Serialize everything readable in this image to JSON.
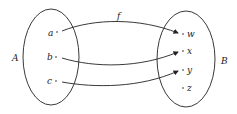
{
  "diagram": {
    "type": "function-mapping",
    "function_label": "f",
    "domain": {
      "label": "A",
      "elements": [
        "a",
        "b",
        "c"
      ]
    },
    "codomain": {
      "label": "B",
      "elements": [
        "w",
        "x",
        "y",
        "z"
      ]
    },
    "mappings": [
      {
        "from": "a",
        "to": "w"
      },
      {
        "from": "b",
        "to": "x"
      },
      {
        "from": "c",
        "to": "y"
      }
    ]
  }
}
